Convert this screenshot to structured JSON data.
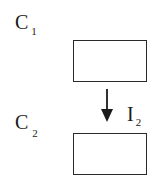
{
  "diagram": {
    "compartments": [
      {
        "id": "C1",
        "label": "C",
        "subscript": "1",
        "box": {
          "x": 73,
          "y": 40,
          "width": 73,
          "height": 41
        }
      },
      {
        "id": "C2",
        "label": "C",
        "subscript": "2",
        "box": {
          "x": 73,
          "y": 133,
          "width": 73,
          "height": 41
        }
      }
    ],
    "flows": [
      {
        "id": "I2",
        "from": "C1",
        "to": "C2",
        "label": "I",
        "subscript": "2",
        "direction": "down"
      }
    ],
    "colors": {
      "stroke": "#2a2a2a",
      "text": "#1a1a1a",
      "background": "#ffffff"
    }
  }
}
